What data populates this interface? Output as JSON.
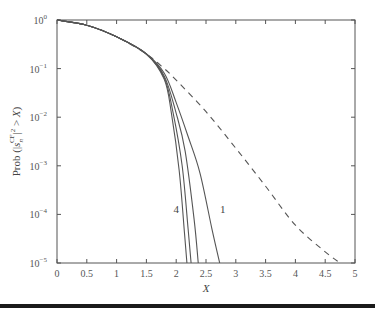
{
  "chart_data": {
    "type": "line",
    "title": "",
    "xlabel": "X",
    "ylabel": "Prob (|s_n^{CF}|^2 > X)",
    "xlim": [
      0,
      5
    ],
    "ylim": [
      1e-05,
      1
    ],
    "yscale": "log",
    "grid": false,
    "x_ticks": [
      "0",
      "0.5",
      "1",
      "1.5",
      "2",
      "2.5",
      "3",
      "3.5",
      "4",
      "4.5",
      "5"
    ],
    "y_ticks": [
      {
        "base": "10",
        "exp": "0"
      },
      {
        "base": "10",
        "exp": "−1"
      },
      {
        "base": "10",
        "exp": "−2"
      },
      {
        "base": "10",
        "exp": "−3"
      },
      {
        "base": "10",
        "exp": "−4"
      },
      {
        "base": "10",
        "exp": "−5"
      }
    ],
    "annotations": [
      {
        "text": "4",
        "x": 2.0,
        "y": 0.00013
      },
      {
        "text": "1",
        "x": 2.78,
        "y": 0.00013
      }
    ],
    "series": [
      {
        "name": "dashed (reference)",
        "style": "dashed",
        "x": [
          0,
          0.5,
          1.0,
          1.5,
          1.8,
          2.0,
          2.5,
          3.0,
          3.5,
          4.0,
          4.5,
          4.75
        ],
        "y": [
          1.0,
          0.78,
          0.45,
          0.2,
          0.1,
          0.058,
          0.013,
          0.0023,
          0.00038,
          6e-05,
          1.7e-05,
          1e-05
        ]
      },
      {
        "name": "1",
        "style": "solid",
        "x": [
          0,
          0.5,
          1.0,
          1.5,
          1.8,
          2.0,
          2.2,
          2.4,
          2.6,
          2.73
        ],
        "y": [
          1.0,
          0.78,
          0.45,
          0.2,
          0.08,
          0.02,
          0.004,
          0.0007,
          5e-05,
          1e-05
        ]
      },
      {
        "name": "2",
        "style": "solid",
        "x": [
          0,
          0.5,
          1.0,
          1.5,
          1.8,
          2.0,
          2.15,
          2.3,
          2.37
        ],
        "y": [
          1.0,
          0.78,
          0.45,
          0.2,
          0.07,
          0.012,
          0.002,
          8e-05,
          1e-05
        ]
      },
      {
        "name": "3",
        "style": "solid",
        "x": [
          0,
          0.5,
          1.0,
          1.5,
          1.8,
          1.95,
          2.1,
          2.2,
          2.25
        ],
        "y": [
          1.0,
          0.78,
          0.45,
          0.2,
          0.065,
          0.012,
          0.001,
          5e-05,
          1e-05
        ]
      },
      {
        "name": "4",
        "style": "solid",
        "x": [
          0,
          0.5,
          1.0,
          1.5,
          1.8,
          1.92,
          2.05,
          2.14,
          2.18
        ],
        "y": [
          1.0,
          0.78,
          0.45,
          0.2,
          0.06,
          0.012,
          0.0008,
          4e-05,
          1e-05
        ]
      }
    ]
  },
  "plot": {
    "left": 57,
    "top": 20,
    "right": 355,
    "bottom": 263
  }
}
